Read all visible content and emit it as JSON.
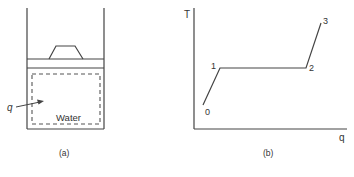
{
  "figure": {
    "panel_a": {
      "label": "(a)",
      "contents_label": "Water",
      "heat_label": "q"
    },
    "panel_b": {
      "label": "(b)",
      "y_axis_label": "T",
      "x_axis_label": "q",
      "points": [
        {
          "id": "0",
          "label": "0"
        },
        {
          "id": "1",
          "label": "1"
        },
        {
          "id": "2",
          "label": "2"
        },
        {
          "id": "3",
          "label": "3"
        }
      ]
    },
    "caption_visible": false
  },
  "colors": {
    "line": "#333333",
    "dashed": "#555555",
    "background": "#ffffff"
  }
}
